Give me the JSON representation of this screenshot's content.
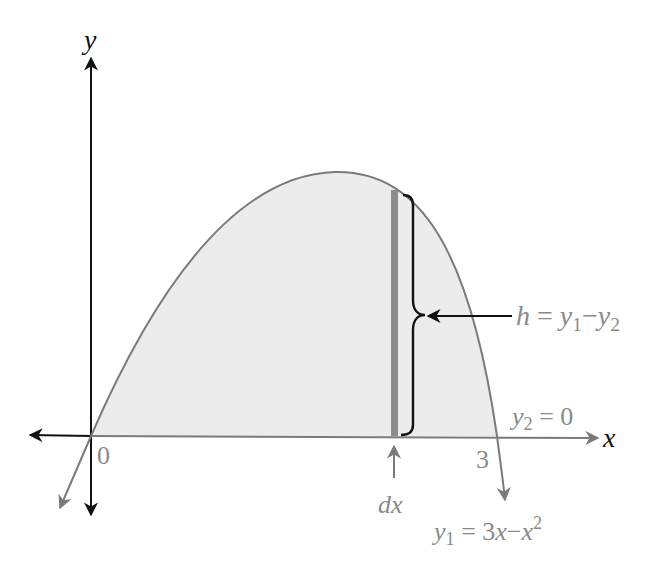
{
  "diagram": {
    "axes": {
      "x_label": "x",
      "y_label": "y",
      "ticks": {
        "origin": "0",
        "x_end": "3"
      }
    },
    "curve": {
      "label_var": "y",
      "label_sub": "1",
      "label_eq": " = 3",
      "label_x": "x",
      "label_minus": "−",
      "label_x2": "x",
      "label_exp": "2"
    },
    "baseline": {
      "label_var": "y",
      "label_sub": "2",
      "label_eq": " = 0"
    },
    "strip": {
      "width_label": "dx",
      "height_var": "h",
      "height_eq": " = ",
      "height_y1": "y",
      "height_sub1": "1",
      "height_minus": "−",
      "height_y2": "y",
      "height_sub2": "2"
    },
    "colors": {
      "axis_black": "#111111",
      "curve_gray": "#7a7a7a",
      "region_fill": "#ececec",
      "strip_fill": "#8c8c8c",
      "label_gray": "#8a8a8a"
    }
  }
}
